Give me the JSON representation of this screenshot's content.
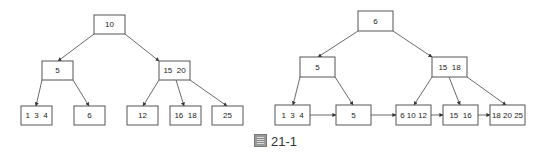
{
  "caption": {
    "prefix_glyph": "圖",
    "label": "21-1"
  },
  "left_tree": {
    "title": "B-tree",
    "nodes": [
      {
        "id": "L-root",
        "label": "10",
        "x": 94,
        "y": 15,
        "w": 31,
        "h": 19
      },
      {
        "id": "L-a",
        "label": "5",
        "x": 42,
        "y": 61,
        "w": 31,
        "h": 19
      },
      {
        "id": "L-b",
        "label": "15  20",
        "x": 159,
        "y": 61,
        "w": 31,
        "h": 19
      },
      {
        "id": "L-leaf1",
        "label": "1  3  4",
        "x": 21,
        "y": 106,
        "w": 31,
        "h": 19
      },
      {
        "id": "L-leaf2",
        "label": "6",
        "x": 74,
        "y": 106,
        "w": 31,
        "h": 19
      },
      {
        "id": "L-leaf3",
        "label": "12",
        "x": 127,
        "y": 106,
        "w": 31,
        "h": 19
      },
      {
        "id": "L-leaf4",
        "label": "16  18",
        "x": 170,
        "y": 106,
        "w": 31,
        "h": 19
      },
      {
        "id": "L-leaf5",
        "label": "25",
        "x": 212,
        "y": 106,
        "w": 31,
        "h": 19
      }
    ],
    "edges": [
      {
        "from": [
          94,
          34
        ],
        "to": [
          58,
          61
        ]
      },
      {
        "from": [
          125,
          34
        ],
        "to": [
          159,
          61
        ]
      },
      {
        "from": [
          42,
          80
        ],
        "to": [
          36,
          106
        ]
      },
      {
        "from": [
          73,
          80
        ],
        "to": [
          89,
          106
        ]
      },
      {
        "from": [
          159,
          80
        ],
        "to": [
          143,
          106
        ]
      },
      {
        "from": [
          176,
          80
        ],
        "to": [
          184,
          106
        ]
      },
      {
        "from": [
          190,
          80
        ],
        "to": [
          227,
          106
        ]
      }
    ]
  },
  "right_tree": {
    "title": "B+ tree",
    "nodes": [
      {
        "id": "R-root",
        "label": "6",
        "x": 358,
        "y": 11,
        "w": 35,
        "h": 20
      },
      {
        "id": "R-a",
        "label": "5",
        "x": 300,
        "y": 57,
        "w": 35,
        "h": 20
      },
      {
        "id": "R-b",
        "label": "15  18",
        "x": 432,
        "y": 57,
        "w": 35,
        "h": 20
      },
      {
        "id": "R-leaf1",
        "label": "1  3  4",
        "x": 275,
        "y": 105,
        "w": 35,
        "h": 20
      },
      {
        "id": "R-leaf2",
        "label": "5",
        "x": 336,
        "y": 105,
        "w": 35,
        "h": 20
      },
      {
        "id": "R-leaf3",
        "label": "6 10 12",
        "x": 396,
        "y": 105,
        "w": 35,
        "h": 20
      },
      {
        "id": "R-leaf4",
        "label": "15  16",
        "x": 443,
        "y": 105,
        "w": 35,
        "h": 20
      },
      {
        "id": "R-leaf5",
        "label": "18 20 25",
        "x": 490,
        "y": 105,
        "w": 35,
        "h": 20
      }
    ],
    "edges": [
      {
        "from": [
          358,
          31
        ],
        "to": [
          318,
          57
        ]
      },
      {
        "from": [
          393,
          31
        ],
        "to": [
          432,
          57
        ]
      },
      {
        "from": [
          300,
          77
        ],
        "to": [
          293,
          105
        ]
      },
      {
        "from": [
          335,
          77
        ],
        "to": [
          353,
          105
        ]
      },
      {
        "from": [
          432,
          77
        ],
        "to": [
          414,
          105
        ]
      },
      {
        "from": [
          449,
          77
        ],
        "to": [
          460,
          105
        ]
      },
      {
        "from": [
          467,
          77
        ],
        "to": [
          506,
          105
        ]
      },
      {
        "from": [
          310,
          115
        ],
        "to": [
          336,
          115
        ]
      },
      {
        "from": [
          371,
          115
        ],
        "to": [
          396,
          115
        ]
      },
      {
        "from": [
          431,
          115
        ],
        "to": [
          443,
          115
        ]
      },
      {
        "from": [
          478,
          115
        ],
        "to": [
          490,
          115
        ]
      }
    ]
  },
  "colors": {
    "stroke": "#555555",
    "edge": "#444444",
    "text": "#222222",
    "background": "#ffffff"
  }
}
